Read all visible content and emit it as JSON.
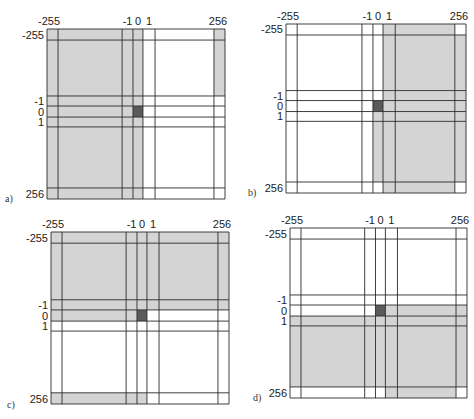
{
  "figure": {
    "colors": {
      "shade": "#d4d4d4",
      "center": "#5a5a5a",
      "line": "#2a2a2a",
      "background": "#ffffff"
    },
    "axis_labels": [
      "-255",
      "-1",
      "0",
      "1",
      "256"
    ],
    "grid_bands": [
      "-255",
      "neg-range",
      "-1",
      "0",
      "1",
      "pos-range",
      "256"
    ],
    "panels": [
      {
        "label": "a)",
        "description": "left half (columns -255..0) shaded, plus column 256 for rows -255..-1",
        "shaded_cells": [
          [
            1,
            1,
            1,
            1,
            0,
            0,
            1
          ],
          [
            1,
            1,
            1,
            1,
            0,
            0,
            1
          ],
          [
            1,
            1,
            1,
            1,
            0,
            0,
            0
          ],
          [
            1,
            1,
            1,
            2,
            0,
            0,
            0
          ],
          [
            1,
            1,
            1,
            1,
            0,
            0,
            0
          ],
          [
            1,
            1,
            1,
            1,
            0,
            0,
            0
          ],
          [
            1,
            1,
            1,
            1,
            0,
            0,
            0
          ]
        ]
      },
      {
        "label": "b)",
        "description": "right half (columns 1..256) shaded, plus column 0 for rows 0..256",
        "shaded_cells": [
          [
            0,
            0,
            0,
            0,
            1,
            1,
            0
          ],
          [
            0,
            0,
            0,
            0,
            1,
            1,
            1
          ],
          [
            0,
            0,
            0,
            0,
            1,
            1,
            1
          ],
          [
            0,
            0,
            0,
            2,
            1,
            1,
            1
          ],
          [
            0,
            0,
            0,
            1,
            1,
            1,
            1
          ],
          [
            0,
            0,
            0,
            1,
            1,
            1,
            1
          ],
          [
            0,
            0,
            0,
            0,
            1,
            1,
            0
          ]
        ]
      },
      {
        "label": "c)",
        "description": "top half (rows -255..-1) shaded, row 0 shaded for columns -255..0, plus row 256 for columns -255..0",
        "shaded_cells": [
          [
            1,
            1,
            1,
            1,
            1,
            1,
            1
          ],
          [
            1,
            1,
            1,
            1,
            1,
            1,
            1
          ],
          [
            1,
            1,
            1,
            1,
            1,
            1,
            1
          ],
          [
            1,
            1,
            1,
            2,
            0,
            0,
            0
          ],
          [
            0,
            0,
            0,
            0,
            0,
            0,
            0
          ],
          [
            0,
            0,
            0,
            0,
            0,
            0,
            0
          ],
          [
            1,
            1,
            1,
            1,
            0,
            0,
            0
          ]
        ]
      },
      {
        "label": "d)",
        "description": "bottom half (rows 1..256) shaded, row 0 shaded for columns 0..256",
        "shaded_cells": [
          [
            0,
            0,
            0,
            0,
            0,
            0,
            0
          ],
          [
            0,
            0,
            0,
            0,
            0,
            0,
            0
          ],
          [
            0,
            0,
            0,
            0,
            0,
            0,
            0
          ],
          [
            0,
            0,
            0,
            2,
            1,
            1,
            1
          ],
          [
            1,
            1,
            1,
            1,
            1,
            1,
            1
          ],
          [
            1,
            1,
            1,
            1,
            1,
            1,
            1
          ],
          [
            0,
            0,
            0,
            0,
            1,
            1,
            0
          ]
        ]
      }
    ]
  }
}
